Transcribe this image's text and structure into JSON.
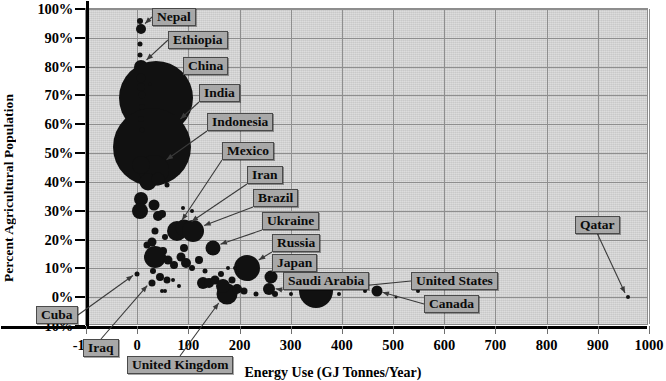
{
  "chart_data": {
    "type": "scatter",
    "title": "",
    "xlabel": "Energy Use (GJ Tonnes/Year)",
    "ylabel": "Percent Agricultural Population",
    "xlim": [
      -100,
      1000
    ],
    "ylim": [
      -10,
      100
    ],
    "xticks": [
      "-100",
      "0",
      "100",
      "200",
      "300",
      "400",
      "500",
      "600",
      "700",
      "800",
      "900",
      "1000"
    ],
    "yticks": [
      "100%",
      "90%",
      "80%",
      "70%",
      "60%",
      "50%",
      "40%",
      "30%",
      "20%",
      "10%",
      "0%",
      "-10%"
    ],
    "grid": true,
    "legend": "none",
    "bubble_note": "Bubble area encodes population size",
    "points": [
      {
        "name": "Nepal",
        "x": 8,
        "y": 93,
        "size": 10,
        "labeled": true
      },
      {
        "name": "Ethiopia",
        "x": 8,
        "y": 80,
        "size": 14,
        "labeled": true
      },
      {
        "name": "China",
        "x": 37,
        "y": 69,
        "size": 74,
        "labeled": true
      },
      {
        "name": "India",
        "x": 28,
        "y": 52,
        "size": 78,
        "labeled": true
      },
      {
        "name": "Indonesia",
        "x": 33,
        "y": 44,
        "size": 30,
        "labeled": true
      },
      {
        "name": "Mexico",
        "x": 77,
        "y": 23,
        "size": 20,
        "labeled": true
      },
      {
        "name": "Iran",
        "x": 92,
        "y": 24,
        "size": 17,
        "labeled": true
      },
      {
        "name": "Brazil",
        "x": 110,
        "y": 23,
        "size": 22,
        "labeled": true
      },
      {
        "name": "Ukraine",
        "x": 148,
        "y": 17,
        "size": 15,
        "labeled": true
      },
      {
        "name": "Russia",
        "x": 215,
        "y": 10,
        "size": 26,
        "labeled": true
      },
      {
        "name": "Japan",
        "x": 262,
        "y": 7,
        "size": 13,
        "labeled": true
      },
      {
        "name": "Saudi Arabia",
        "x": 258,
        "y": 3,
        "size": 12,
        "labeled": true
      },
      {
        "name": "United States",
        "x": 350,
        "y": 2,
        "size": 34,
        "labeled": true
      },
      {
        "name": "Canada",
        "x": 468,
        "y": 2,
        "size": 11,
        "labeled": true
      },
      {
        "name": "Qatar",
        "x": 958,
        "y": 0,
        "size": 4,
        "labeled": true
      },
      {
        "name": "Cuba",
        "x": 0,
        "y": 8,
        "size": 5,
        "labeled": true
      },
      {
        "name": "Iraq",
        "x": 28,
        "y": 5,
        "size": 7,
        "labeled": true
      },
      {
        "name": "United Kingdom",
        "x": 175,
        "y": 1,
        "size": 21,
        "labeled": true
      },
      {
        "name": "",
        "x": 5,
        "y": 96,
        "size": 6
      },
      {
        "name": "",
        "x": 5,
        "y": 88,
        "size": 5
      },
      {
        "name": "",
        "x": 6,
        "y": 84,
        "size": 5
      },
      {
        "name": "",
        "x": 7,
        "y": 76,
        "size": 9
      },
      {
        "name": "",
        "x": 8,
        "y": 73,
        "size": 8
      },
      {
        "name": "",
        "x": 9,
        "y": 70,
        "size": 7
      },
      {
        "name": "",
        "x": 26,
        "y": 74,
        "size": 3
      },
      {
        "name": "",
        "x": 9,
        "y": 66,
        "size": 6
      },
      {
        "name": "",
        "x": 7,
        "y": 62,
        "size": 6
      },
      {
        "name": "",
        "x": 10,
        "y": 58,
        "size": 5
      },
      {
        "name": "",
        "x": 8,
        "y": 46,
        "size": 18
      },
      {
        "name": "",
        "x": 22,
        "y": 40,
        "size": 17
      },
      {
        "name": "",
        "x": 40,
        "y": 41,
        "size": 13
      },
      {
        "name": "",
        "x": 58,
        "y": 39,
        "size": 5
      },
      {
        "name": "",
        "x": 7,
        "y": 34,
        "size": 14
      },
      {
        "name": "",
        "x": 32,
        "y": 32,
        "size": 11
      },
      {
        "name": "",
        "x": 5,
        "y": 30,
        "size": 16
      },
      {
        "name": "",
        "x": 40,
        "y": 28,
        "size": 10
      },
      {
        "name": "",
        "x": 48,
        "y": 29,
        "size": 8
      },
      {
        "name": "",
        "x": 90,
        "y": 31,
        "size": 4
      },
      {
        "name": "",
        "x": 108,
        "y": 30,
        "size": 4
      },
      {
        "name": "",
        "x": 35,
        "y": 23,
        "size": 7
      },
      {
        "name": "",
        "x": 55,
        "y": 21,
        "size": 6
      },
      {
        "name": "",
        "x": 29,
        "y": 19,
        "size": 9
      },
      {
        "name": "",
        "x": 50,
        "y": 16,
        "size": 8
      },
      {
        "name": "",
        "x": 20,
        "y": 18,
        "size": 7
      },
      {
        "name": "",
        "x": 35,
        "y": 14,
        "size": 22
      },
      {
        "name": "",
        "x": 60,
        "y": 13,
        "size": 9
      },
      {
        "name": "",
        "x": 72,
        "y": 11,
        "size": 8
      },
      {
        "name": "",
        "x": 86,
        "y": 14,
        "size": 9
      },
      {
        "name": "",
        "x": 96,
        "y": 12,
        "size": 10
      },
      {
        "name": "",
        "x": 92,
        "y": 17,
        "size": 8
      },
      {
        "name": "",
        "x": 108,
        "y": 10,
        "size": 6
      },
      {
        "name": "",
        "x": 120,
        "y": 13,
        "size": 8
      },
      {
        "name": "",
        "x": 132,
        "y": 9,
        "size": 5
      },
      {
        "name": "",
        "x": 30,
        "y": 9,
        "size": 6
      },
      {
        "name": "",
        "x": 45,
        "y": 7,
        "size": 8
      },
      {
        "name": "",
        "x": 58,
        "y": 6,
        "size": 7
      },
      {
        "name": "",
        "x": 70,
        "y": 6,
        "size": 4
      },
      {
        "name": "",
        "x": 82,
        "y": 4,
        "size": 4
      },
      {
        "name": "",
        "x": 48,
        "y": 2,
        "size": 4
      },
      {
        "name": "",
        "x": 54,
        "y": 2,
        "size": 4
      },
      {
        "name": "",
        "x": 128,
        "y": 5,
        "size": 12
      },
      {
        "name": "",
        "x": 140,
        "y": 5,
        "size": 10
      },
      {
        "name": "",
        "x": 152,
        "y": 6,
        "size": 9
      },
      {
        "name": "",
        "x": 163,
        "y": 8,
        "size": 6
      },
      {
        "name": "",
        "x": 168,
        "y": 4,
        "size": 14
      },
      {
        "name": "",
        "x": 186,
        "y": 6,
        "size": 7
      },
      {
        "name": "",
        "x": 196,
        "y": 3,
        "size": 10
      },
      {
        "name": "",
        "x": 178,
        "y": 10,
        "size": 4
      },
      {
        "name": "",
        "x": 192,
        "y": 10,
        "size": 4
      },
      {
        "name": "",
        "x": 208,
        "y": 2,
        "size": 7
      },
      {
        "name": "",
        "x": 232,
        "y": 1,
        "size": 5
      },
      {
        "name": "",
        "x": 258,
        "y": 8,
        "size": 3
      },
      {
        "name": "",
        "x": 270,
        "y": 1,
        "size": 6
      },
      {
        "name": "",
        "x": 300,
        "y": 1,
        "size": 4
      },
      {
        "name": "",
        "x": 395,
        "y": 1,
        "size": 4
      },
      {
        "name": "",
        "x": 420,
        "y": 4,
        "size": 5
      },
      {
        "name": "",
        "x": 445,
        "y": 2,
        "size": 4
      },
      {
        "name": "",
        "x": 506,
        "y": 0,
        "size": 3
      },
      {
        "name": "",
        "x": 548,
        "y": 2,
        "size": 4
      },
      {
        "name": "",
        "x": 615,
        "y": 0,
        "size": 3
      }
    ]
  },
  "axes": {
    "y_title": "Percent Agricultural Population",
    "x_title": "Energy Use (GJ Tonnes/Year)"
  },
  "callouts": [
    {
      "name": "Nepal",
      "text": "Nepal"
    },
    {
      "name": "Ethiopia",
      "text": "Ethiopia"
    },
    {
      "name": "China",
      "text": "China"
    },
    {
      "name": "India",
      "text": "India"
    },
    {
      "name": "Indonesia",
      "text": "Indonesia"
    },
    {
      "name": "Mexico",
      "text": "Mexico"
    },
    {
      "name": "Iran",
      "text": "Iran"
    },
    {
      "name": "Brazil",
      "text": "Brazil"
    },
    {
      "name": "Ukraine",
      "text": "Ukraine"
    },
    {
      "name": "Russia",
      "text": "Russia"
    },
    {
      "name": "Japan",
      "text": "Japan"
    },
    {
      "name": "SaudiArabia",
      "text": "Saudi Arabia"
    },
    {
      "name": "UnitedStates",
      "text": "United States"
    },
    {
      "name": "Canada",
      "text": "Canada"
    },
    {
      "name": "Qatar",
      "text": "Qatar"
    },
    {
      "name": "Cuba",
      "text": "Cuba"
    },
    {
      "name": "Iraq",
      "text": "Iraq"
    },
    {
      "name": "UnitedKingdom",
      "text": "United Kingdom"
    }
  ],
  "colors": {
    "plot_background": "#d4d4d4",
    "gridline": "#8e8e8e",
    "axis": "#000000",
    "bubble": "#111111",
    "callout_fill": "#a8a8a8",
    "callout_border": "#4a4a4a",
    "page_background": "#ffffff"
  }
}
